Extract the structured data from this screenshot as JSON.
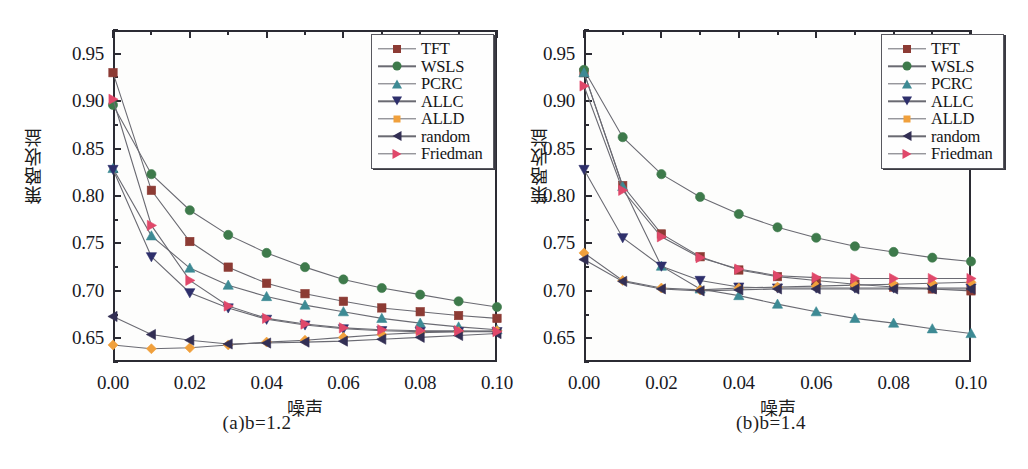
{
  "figure": {
    "panels": [
      {
        "caption_prefix": "(a)",
        "caption_var": "b",
        "caption_eq": "=1.2",
        "caption": "(a)b=1.2"
      },
      {
        "caption_prefix": "(b)",
        "caption_var": "b",
        "caption_eq": "=1.4",
        "caption": "(b)b=1.4"
      }
    ],
    "xlabel": "噪声",
    "ylabel": "策略收益"
  },
  "legend": {
    "entries": [
      {
        "label": "TFT",
        "color": "#8c3b34",
        "marker": "square"
      },
      {
        "label": "WSLS",
        "color": "#3e7a4b",
        "marker": "circle"
      },
      {
        "label": "PCRC",
        "color": "#3d8a94",
        "marker": "triangle-up"
      },
      {
        "label": "ALLC",
        "color": "#2e2f6b",
        "marker": "triangle-down"
      },
      {
        "label": "ALLD",
        "color": "#eba košice",
        "marker": "diamond"
      },
      {
        "label": "random",
        "color": "#332f54",
        "marker": "triangle-left"
      },
      {
        "label": "Friedman",
        "color": "#e0486a",
        "marker": "triangle-right"
      }
    ]
  },
  "axes": {
    "yticks": [
      "0.95",
      "0.90",
      "0.85",
      "0.80",
      "0.75",
      "0.70",
      "0.65"
    ],
    "ytick_values": [
      0.95,
      0.9,
      0.85,
      0.8,
      0.75,
      0.7,
      0.65
    ],
    "xticks": [
      "0.00",
      "0.02",
      "0.04",
      "0.06",
      "0.08",
      "0.10"
    ],
    "xtick_values": [
      0.0,
      0.02,
      0.04,
      0.06,
      0.08,
      0.1
    ],
    "xlim": [
      0.0,
      0.1
    ],
    "ylim": [
      0.625,
      0.975
    ]
  },
  "chart_data": [
    {
      "type": "line",
      "title": "(a)b=1.2",
      "xlabel": "噪声",
      "ylabel": "策略收益",
      "xlim": [
        0.0,
        0.1
      ],
      "ylim": [
        0.625,
        0.975
      ],
      "grid": false,
      "legend_position": "top-right",
      "x": [
        0.0,
        0.01,
        0.02,
        0.03,
        0.04,
        0.05,
        0.06,
        0.07,
        0.08,
        0.09,
        0.1
      ],
      "series": [
        {
          "name": "TFT",
          "color": "#8c3b34",
          "marker": "square",
          "values": [
            0.93,
            0.806,
            0.752,
            0.725,
            0.708,
            0.697,
            0.689,
            0.682,
            0.678,
            0.674,
            0.671
          ]
        },
        {
          "name": "WSLS",
          "color": "#3e7a4b",
          "marker": "circle",
          "values": [
            0.896,
            0.823,
            0.785,
            0.759,
            0.74,
            0.725,
            0.712,
            0.703,
            0.696,
            0.689,
            0.683
          ]
        },
        {
          "name": "PCRC",
          "color": "#3d8a94",
          "marker": "triangle-up",
          "values": [
            0.829,
            0.758,
            0.724,
            0.706,
            0.694,
            0.685,
            0.678,
            0.671,
            0.666,
            0.662,
            0.659
          ]
        },
        {
          "name": "ALLC",
          "color": "#2e2f6b",
          "marker": "triangle-down",
          "values": [
            0.828,
            0.736,
            0.698,
            0.682,
            0.67,
            0.664,
            0.66,
            0.658,
            0.657,
            0.657,
            0.657
          ]
        },
        {
          "name": "ALLD",
          "color": "#f0a03c",
          "marker": "diamond",
          "values": [
            0.643,
            0.639,
            0.64,
            0.643,
            0.646,
            0.648,
            0.651,
            0.654,
            0.656,
            0.657,
            0.658
          ]
        },
        {
          "name": "random",
          "color": "#332f54",
          "marker": "triangle-left",
          "values": [
            0.673,
            0.654,
            0.648,
            0.644,
            0.645,
            0.646,
            0.647,
            0.649,
            0.651,
            0.653,
            0.655
          ]
        },
        {
          "name": "Friedman",
          "color": "#e0486a",
          "marker": "triangle-right",
          "values": [
            0.902,
            0.769,
            0.711,
            0.684,
            0.671,
            0.665,
            0.661,
            0.659,
            0.658,
            0.658,
            0.657
          ]
        }
      ]
    },
    {
      "type": "line",
      "title": "(b)b=1.4",
      "xlabel": "噪声",
      "ylabel": "策略收益",
      "xlim": [
        0.0,
        0.1
      ],
      "ylim": [
        0.625,
        0.975
      ],
      "grid": false,
      "legend_position": "top-right",
      "x": [
        0.0,
        0.01,
        0.02,
        0.03,
        0.04,
        0.05,
        0.06,
        0.07,
        0.08,
        0.09,
        0.1
      ],
      "series": [
        {
          "name": "TFT",
          "color": "#8c3b34",
          "marker": "square",
          "values": [
            0.93,
            0.811,
            0.76,
            0.736,
            0.722,
            0.715,
            0.711,
            0.707,
            0.704,
            0.702,
            0.7
          ]
        },
        {
          "name": "WSLS",
          "color": "#3e7a4b",
          "marker": "circle",
          "values": [
            0.933,
            0.862,
            0.823,
            0.799,
            0.781,
            0.767,
            0.756,
            0.747,
            0.741,
            0.735,
            0.731
          ]
        },
        {
          "name": "PCRC",
          "color": "#3d8a94",
          "marker": "triangle-up",
          "values": [
            0.93,
            0.81,
            0.726,
            0.702,
            0.695,
            0.686,
            0.678,
            0.671,
            0.666,
            0.66,
            0.655
          ]
        },
        {
          "name": "ALLC",
          "color": "#2e2f6b",
          "marker": "triangle-down",
          "values": [
            0.828,
            0.756,
            0.726,
            0.711,
            0.704,
            0.703,
            0.703,
            0.703,
            0.703,
            0.703,
            0.703
          ]
        },
        {
          "name": "ALLD",
          "color": "#f0a03c",
          "marker": "diamond",
          "values": [
            0.74,
            0.711,
            0.703,
            0.701,
            0.703,
            0.704,
            0.705,
            0.706,
            0.707,
            0.708,
            0.709
          ]
        },
        {
          "name": "random",
          "color": "#332f54",
          "marker": "triangle-left",
          "values": [
            0.733,
            0.71,
            0.702,
            0.7,
            0.701,
            0.702,
            0.702,
            0.702,
            0.702,
            0.702,
            0.702
          ]
        },
        {
          "name": "Friedman",
          "color": "#e0486a",
          "marker": "triangle-right",
          "values": [
            0.916,
            0.806,
            0.757,
            0.735,
            0.723,
            0.716,
            0.714,
            0.713,
            0.713,
            0.713,
            0.713
          ]
        }
      ]
    }
  ]
}
